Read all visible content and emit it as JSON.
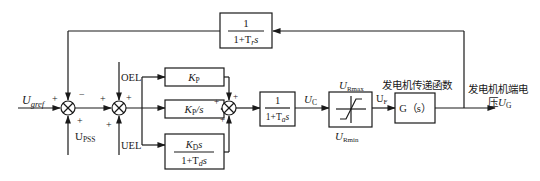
{
  "diagram": {
    "type": "block-diagram",
    "title": "",
    "inputs": {
      "reference": {
        "main": "U",
        "sub": "gref"
      },
      "pss": {
        "main": "U",
        "sub": "PSS"
      },
      "oel": "OEL",
      "uel": "UEL"
    },
    "feedback_block": {
      "numerator": "1",
      "denominator": "1+T",
      "den_sub": "r",
      "den_var": "s"
    },
    "pid_blocks": {
      "proportional": {
        "main": "K",
        "sub": "P"
      },
      "integral": {
        "main": "K",
        "sub": "P",
        "suffix": "/s"
      },
      "derivative": {
        "num_main": "K",
        "num_sub": "D",
        "num_var": "s",
        "den_prefix": "1+T",
        "den_sub": "d",
        "den_var": "s"
      }
    },
    "actuator_block": {
      "numerator": "1",
      "denominator": "1+T",
      "den_sub": "a",
      "den_var": "s"
    },
    "signals": {
      "uc": {
        "main": "U",
        "sub": "C"
      },
      "uf": {
        "main": "U",
        "sub": "F"
      },
      "ug": {
        "main": "U",
        "sub": "G"
      }
    },
    "limiter": {
      "max": {
        "main": "U",
        "sub": "Rmax"
      },
      "min": {
        "main": "U",
        "sub": "Rmin"
      }
    },
    "generator_block": {
      "label": "G（s）",
      "caption": "发电机传递函数"
    },
    "output": {
      "caption_line1": "发电机机端电",
      "caption_line2_prefix": "压"
    },
    "signs": {
      "sum1_left": "+",
      "sum1_top": "−",
      "sum1_bottom": "+",
      "sum2_left": "+",
      "sum2_top": "+",
      "sum2_bottom": "+",
      "sum3_left": "+",
      "sum3_top": "+",
      "sum3_bottom": "+"
    }
  }
}
